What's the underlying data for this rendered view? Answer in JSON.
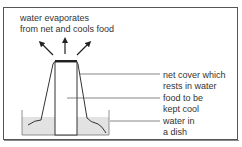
{
  "diagram": {
    "title_annotation": {
      "line1": "water evaporates",
      "line2": "from net and cools food"
    },
    "labels": [
      {
        "id": "net",
        "line1": "net cover which",
        "line2": "rests in water"
      },
      {
        "id": "food",
        "line1": "food to be",
        "line2": "kept cool"
      },
      {
        "id": "water",
        "line1": "water in",
        "line2": "a dish"
      }
    ],
    "arrows": [
      "up-left-arrow",
      "up-arrow",
      "up-right-arrow"
    ],
    "colors": {
      "line": "#333333",
      "water": "#e2e2e2",
      "food": "#ffffff",
      "text": "#333333"
    }
  }
}
